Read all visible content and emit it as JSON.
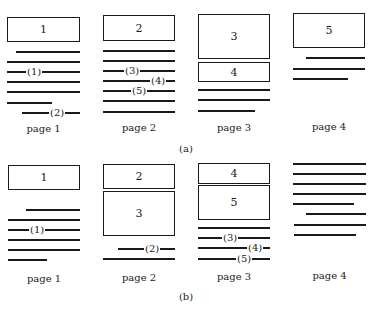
{
  "figure": {
    "caption_a": "(a)",
    "caption_b": "(b)",
    "rows": [
      {
        "id": "a",
        "pages": [
          {
            "label": "page 1",
            "boxes": [
              {
                "text": "1",
                "x": 7,
                "y": 17,
                "w": 73,
                "h": 25
              }
            ],
            "lines": [
              {
                "x1": 16,
                "x2": 80,
                "y": 51
              },
              {
                "x1": 7,
                "x2": 80,
                "y": 61
              },
              {
                "x1": 7,
                "x2": 80,
                "y": 71,
                "ref": "(1)",
                "ref_x": 26
              },
              {
                "x1": 7,
                "x2": 80,
                "y": 81
              },
              {
                "x1": 7,
                "x2": 80,
                "y": 91
              },
              {
                "x1": 7,
                "x2": 52,
                "y": 102
              },
              {
                "x1": 22,
                "x2": 80,
                "y": 112,
                "ref": "(2)",
                "ref_x": 49
              }
            ],
            "label_y": 123
          },
          {
            "label": "page 2",
            "boxes": [
              {
                "text": "2",
                "x": 103,
                "y": 15,
                "w": 72,
                "h": 26
              }
            ],
            "lines": [
              {
                "x1": 103,
                "x2": 175,
                "y": 50
              },
              {
                "x1": 103,
                "x2": 175,
                "y": 60
              },
              {
                "x1": 103,
                "x2": 175,
                "y": 70,
                "ref": "(3)",
                "ref_x": 124
              },
              {
                "x1": 103,
                "x2": 175,
                "y": 80,
                "ref": "(4)",
                "ref_x": 150
              },
              {
                "x1": 103,
                "x2": 175,
                "y": 90,
                "ref": "(5)",
                "ref_x": 131
              },
              {
                "x1": 103,
                "x2": 175,
                "y": 100
              },
              {
                "x1": 103,
                "x2": 175,
                "y": 111
              }
            ],
            "label_y": 122
          },
          {
            "label": "page 3",
            "boxes": [
              {
                "text": "3",
                "x": 198,
                "y": 14,
                "w": 72,
                "h": 45
              },
              {
                "text": "4",
                "x": 198,
                "y": 62,
                "w": 72,
                "h": 20
              }
            ],
            "lines": [
              {
                "x1": 198,
                "x2": 270,
                "y": 89
              },
              {
                "x1": 198,
                "x2": 270,
                "y": 99
              },
              {
                "x1": 198,
                "x2": 255,
                "y": 110
              }
            ],
            "label_y": 122
          },
          {
            "label": "page 4",
            "boxes": [
              {
                "text": "5",
                "x": 293,
                "y": 13,
                "w": 72,
                "h": 35
              }
            ],
            "lines": [
              {
                "x1": 306,
                "x2": 365,
                "y": 57
              },
              {
                "x1": 293,
                "x2": 365,
                "y": 68
              },
              {
                "x1": 293,
                "x2": 348,
                "y": 78
              }
            ],
            "label_y": 121
          }
        ],
        "caption_y": 143
      },
      {
        "id": "b",
        "pages": [
          {
            "label": "page 1",
            "boxes": [
              {
                "text": "1",
                "x": 8,
                "y": 165,
                "w": 72,
                "h": 25
              }
            ],
            "lines": [
              {
                "x1": 26,
                "x2": 80,
                "y": 209
              },
              {
                "x1": 8,
                "x2": 80,
                "y": 219
              },
              {
                "x1": 8,
                "x2": 80,
                "y": 229,
                "ref": "(1)",
                "ref_x": 29
              },
              {
                "x1": 8,
                "x2": 80,
                "y": 239
              },
              {
                "x1": 8,
                "x2": 80,
                "y": 249
              },
              {
                "x1": 8,
                "x2": 47,
                "y": 259
              }
            ],
            "label_y": 273
          },
          {
            "label": "page 2",
            "boxes": [
              {
                "text": "2",
                "x": 103,
                "y": 164,
                "w": 72,
                "h": 25
              },
              {
                "text": "3",
                "x": 103,
                "y": 191,
                "w": 72,
                "h": 45
              }
            ],
            "lines": [
              {
                "x1": 118,
                "x2": 175,
                "y": 248,
                "ref": "(2)",
                "ref_x": 144
              },
              {
                "x1": 103,
                "x2": 175,
                "y": 258
              }
            ],
            "label_y": 272
          },
          {
            "label": "page 3",
            "boxes": [
              {
                "text": "4",
                "x": 198,
                "y": 163,
                "w": 72,
                "h": 21
              },
              {
                "text": "5",
                "x": 198,
                "y": 185,
                "w": 72,
                "h": 35
              }
            ],
            "lines": [
              {
                "x1": 198,
                "x2": 270,
                "y": 227
              },
              {
                "x1": 198,
                "x2": 270,
                "y": 237,
                "ref": "(3)",
                "ref_x": 222
              },
              {
                "x1": 198,
                "x2": 270,
                "y": 247,
                "ref": "(4)",
                "ref_x": 247
              },
              {
                "x1": 198,
                "x2": 270,
                "y": 258,
                "ref": "(5)",
                "ref_x": 236
              }
            ],
            "label_y": 271
          },
          {
            "label": "page 4",
            "boxes": [],
            "lines": [
              {
                "x1": 293,
                "x2": 366,
                "y": 163
              },
              {
                "x1": 293,
                "x2": 366,
                "y": 173
              },
              {
                "x1": 293,
                "x2": 366,
                "y": 183
              },
              {
                "x1": 293,
                "x2": 366,
                "y": 193
              },
              {
                "x1": 293,
                "x2": 354,
                "y": 203
              },
              {
                "x1": 306,
                "x2": 366,
                "y": 213
              },
              {
                "x1": 294,
                "x2": 366,
                "y": 224
              },
              {
                "x1": 294,
                "x2": 356,
                "y": 234
              }
            ],
            "label_y": 270
          }
        ],
        "caption_y": 291
      }
    ]
  }
}
